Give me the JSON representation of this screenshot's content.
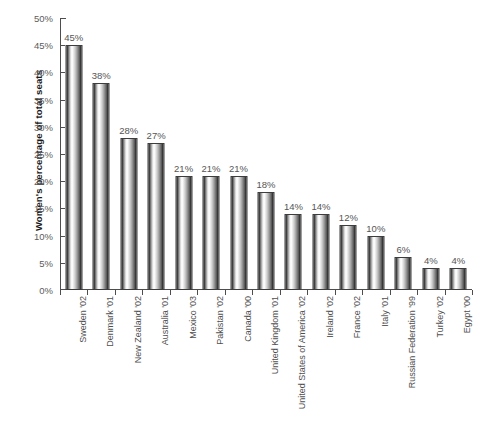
{
  "chart_data": {
    "type": "bar",
    "title": "",
    "xlabel": "",
    "ylabel": "Women's percentage of total seats",
    "ylim": [
      0,
      50
    ],
    "ytick_step": 5,
    "grid": false,
    "legend": "none",
    "value_suffix": "%",
    "categories": [
      "Sweden '02",
      "Denmark '01",
      "New Zealand '02",
      "Australia '01",
      "Mexico '03",
      "Pakistan '02",
      "Canada '00",
      "United Kingdom '01",
      "United States of America '02",
      "Ireland '02",
      "France '02",
      "Italy '01",
      "Russian Federation '99",
      "Turkey '02",
      "Egypt '00"
    ],
    "values": [
      45,
      38,
      28,
      27,
      21,
      21,
      21,
      18,
      14,
      14,
      12,
      10,
      6,
      4,
      4
    ],
    "data_labels": [
      "45%",
      "38%",
      "28%",
      "27%",
      "21%",
      "21%",
      "21%",
      "18%",
      "14%",
      "14%",
      "12%",
      "10%",
      "6%",
      "4%",
      "4%"
    ],
    "ytick_labels": [
      "50%",
      "45%",
      "40%",
      "35%",
      "30%",
      "25%",
      "20%",
      "15%",
      "10%",
      "5%",
      "0%"
    ],
    "ytick_values": [
      50,
      45,
      40,
      35,
      30,
      25,
      20,
      15,
      10,
      5,
      0
    ]
  },
  "colors": {
    "background": "#ffffff",
    "axis": "#4d4d4d",
    "bar_dark": "#1c1c1c",
    "bar_light": "#ffffff",
    "tick_text": "#5c5c5c",
    "axis_title_text": "#1a1a1a",
    "data_label_text": "#555555",
    "footer_text": "#c9c9c9"
  },
  "footer": {
    "note": ""
  }
}
